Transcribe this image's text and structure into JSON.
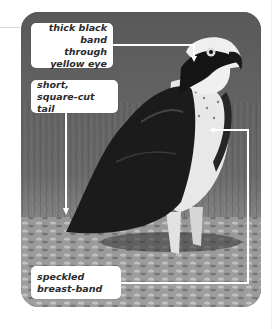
{
  "figure": {
    "labels": [
      {
        "id": "eye",
        "text": "thick black band\nthrough yellow eye"
      },
      {
        "id": "tail",
        "text": "short, square-cut tail"
      },
      {
        "id": "breast",
        "text": "speckled breast-band"
      }
    ]
  },
  "colors": {
    "label_bg": "#ffffff",
    "label_text": "#2b2b2b",
    "leader_line": "#ffffff",
    "photo_bg": "#5c5c5c"
  }
}
